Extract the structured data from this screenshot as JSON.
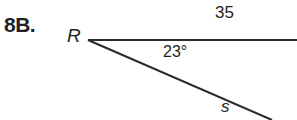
{
  "problem": {
    "number": "8B."
  },
  "figure": {
    "vertex_label": "R",
    "top_side_label": "35",
    "angle_label": "23°",
    "diagonal_side_label": "s",
    "line_color": "#2b2b2b"
  }
}
